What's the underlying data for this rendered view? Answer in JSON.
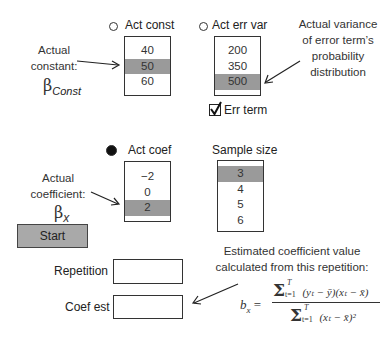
{
  "act_const": {
    "radio_label": "Act const",
    "options": [
      "40",
      "50",
      "60"
    ],
    "selected_index": 1,
    "annotation": [
      "Actual",
      "constant:"
    ],
    "symbol": "β",
    "symbol_sub": "Const"
  },
  "act_err_var": {
    "radio_label": "Act err var",
    "options": [
      "200",
      "350",
      "500"
    ],
    "selected_index": 2,
    "annotation": [
      "Actual variance",
      "of error term’s",
      "probability",
      "distribution"
    ]
  },
  "err_term": {
    "label": "Err term",
    "checked": true
  },
  "act_coef": {
    "radio_label": "Act coef",
    "options": [
      "−2",
      "0",
      "2"
    ],
    "selected_index": 2,
    "annotation": [
      "Actual",
      "coefficient:"
    ],
    "symbol": "β",
    "symbol_sub": "x"
  },
  "sample_size": {
    "label": "Sample size",
    "options": [
      "3",
      "4",
      "5",
      "6"
    ],
    "selected_index": 0
  },
  "start_button": {
    "label": "Start"
  },
  "repetition": {
    "label": "Repetition",
    "value": ""
  },
  "coef_est": {
    "label": "Coef est",
    "value": ""
  },
  "formula_note": {
    "lines": [
      "Estimated coefficient value",
      "calculated from this repetition:"
    ],
    "lhs": "b",
    "lhs_sub": "x",
    "numerator": "(yₜ − ȳ)(xₜ − x̄)",
    "denominator": "(xₜ − x̄)²",
    "sum_lower": "t=1",
    "sum_upper": "T"
  }
}
